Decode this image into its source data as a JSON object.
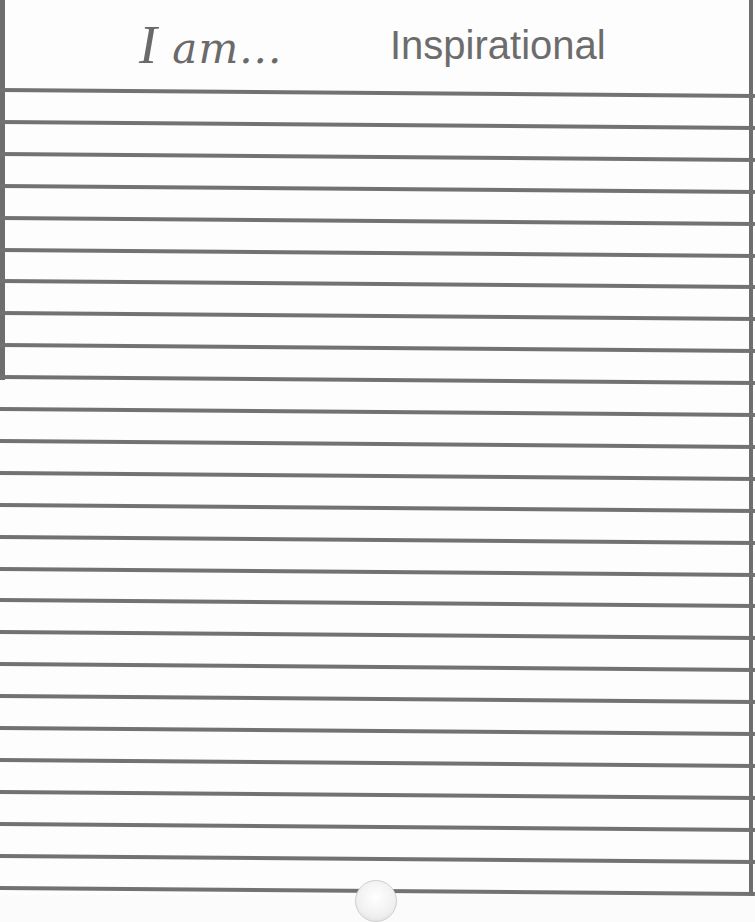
{
  "header": {
    "script_prefix_initial": "I",
    "script_prefix_rest": " am...",
    "category": "Inspirational"
  },
  "lines": {
    "count": 26,
    "first_y": 88,
    "spacing": 31.9,
    "color": "#727272"
  },
  "colors": {
    "paper": "#fdfdfd",
    "ink": "#6a6a6a",
    "border": "#6e6e6e"
  }
}
